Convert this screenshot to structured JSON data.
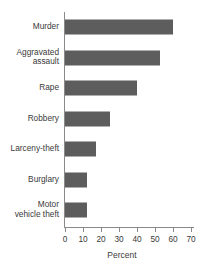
{
  "chart_data": {
    "type": "bar",
    "orientation": "horizontal",
    "title": "",
    "xlabel": "Percent",
    "ylabel": "",
    "xlim": [
      0,
      70
    ],
    "xticks": [
      0,
      10,
      20,
      30,
      40,
      50,
      60,
      70
    ],
    "xtick_labels": [
      "0",
      "10",
      "20",
      "30",
      "40",
      "50",
      "60",
      "70"
    ],
    "grid": false,
    "legend": false,
    "bar_color": "#5d5d5d",
    "axis_color": "#8a8a8a",
    "background_color": "#ffffff",
    "categories": [
      "Murder",
      "Aggravated\nassault",
      "Rape",
      "Robbery",
      "Larceny-theft",
      "Burglary",
      "Motor\nvehicle theft"
    ],
    "values": [
      60,
      53,
      40,
      25,
      17,
      12,
      12
    ]
  }
}
